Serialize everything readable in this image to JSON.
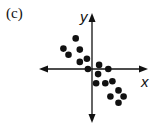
{
  "panel_label": "(c)",
  "axes": {
    "x_label": "x",
    "y_label": "y",
    "color": "#111111"
  },
  "chart_data": {
    "type": "scatter",
    "title": "(c)",
    "xlabel": "x",
    "ylabel": "y",
    "grid": false,
    "legend": null,
    "xlim": [
      -5,
      5
    ],
    "ylim": [
      -5,
      5
    ],
    "points": [
      {
        "x": -1.6,
        "y": 3.0
      },
      {
        "x": -2.8,
        "y": 2.0
      },
      {
        "x": -2.3,
        "y": 1.4
      },
      {
        "x": -1.2,
        "y": 1.9
      },
      {
        "x": -1.2,
        "y": 0.7
      },
      {
        "x": -0.5,
        "y": 1.0
      },
      {
        "x": -0.4,
        "y": 0.0
      },
      {
        "x": 0.7,
        "y": 0.4
      },
      {
        "x": 0.6,
        "y": -0.5
      },
      {
        "x": 1.6,
        "y": 0.0
      },
      {
        "x": 0.4,
        "y": -1.4
      },
      {
        "x": 1.3,
        "y": -1.4
      },
      {
        "x": 2.0,
        "y": -1.2
      },
      {
        "x": 2.6,
        "y": -2.1
      },
      {
        "x": 1.8,
        "y": -2.7
      },
      {
        "x": 3.1,
        "y": -2.7
      },
      {
        "x": 2.6,
        "y": -3.3
      }
    ],
    "point_color": "#111111"
  }
}
